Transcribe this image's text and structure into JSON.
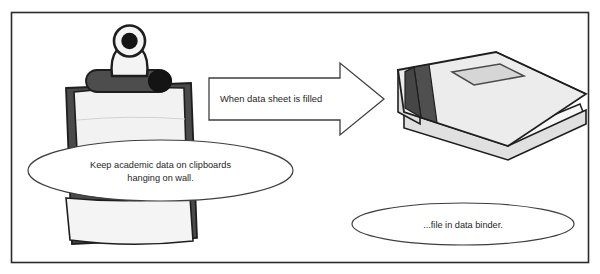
{
  "figure": {
    "frame": {
      "border_color": "#2b2b2b",
      "background_color": "#ffffff"
    }
  },
  "nodes": {
    "clipboard": {
      "name": "clipboard-illustration",
      "board_color": "#4a4a4a",
      "paper_color": "#f2f2f2",
      "clip_color": "#3f3f3f"
    },
    "binder": {
      "name": "data-binder-illustration",
      "cover_color": "#e8e8e8",
      "spine_band_color": "#4d4d4d",
      "label_window_color": "#d9d9d9"
    }
  },
  "arrow": {
    "label": "When data sheet is filled",
    "outline_color": "#3f3f3f",
    "fill_color": "#ffffff"
  },
  "callouts": [
    {
      "name": "clipboard-callout",
      "lines": [
        "Keep academic data on clipboards",
        "hanging on wall."
      ],
      "outline_color": "#3f3f3f"
    },
    {
      "name": "binder-callout",
      "lines": [
        "...file in data binder."
      ],
      "outline_color": "#3f3f3f"
    }
  ]
}
